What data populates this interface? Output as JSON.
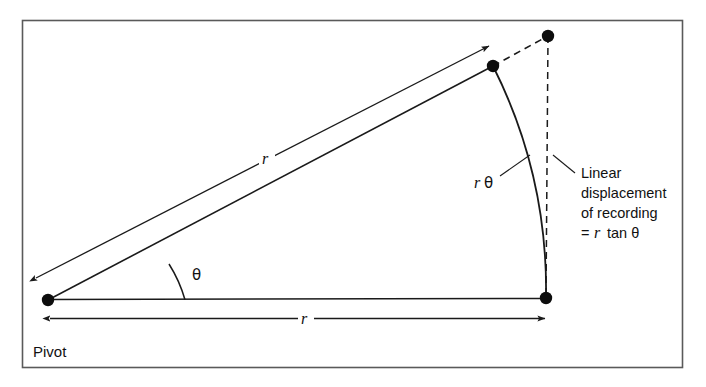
{
  "figure": {
    "background_color": "#ffffff",
    "stroke_color": "#1a1a1a",
    "frame": {
      "border_color": "#5a5a5a",
      "x": 22,
      "y": 20,
      "width": 661,
      "height": 348
    }
  },
  "labels": {
    "pivot": "Pivot",
    "radius_arm": "r",
    "radius_base": "r",
    "angle": "θ",
    "arc_length": "r θ",
    "arc_length_r": "r",
    "arc_length_theta": "θ"
  },
  "annotation": {
    "line1": "Linear",
    "line2": "displacement",
    "line3": "of recording",
    "line4_prefix": "=",
    "line4_r": "r",
    "line4_rest": "tan θ",
    "full_text": "Linear displacement of recording = r tan θ"
  },
  "points": {
    "pivot": {
      "x": 48,
      "y": 300,
      "name": "pivot-point"
    },
    "arm_tip": {
      "x": 493,
      "y": 66,
      "name": "arm-tip-point"
    },
    "upper_right": {
      "x": 548,
      "y": 36,
      "name": "tangent-end-point"
    },
    "base_right": {
      "x": 546,
      "y": 298,
      "name": "baseline-end-point"
    }
  },
  "geometry": {
    "arm_angle_degrees": 28,
    "arc_radius": 498
  }
}
